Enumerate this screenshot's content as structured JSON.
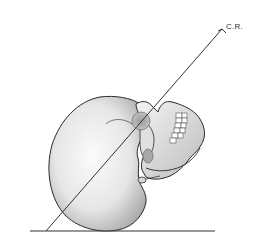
{
  "diagram": {
    "labels": {
      "central_ray": "C.R."
    },
    "colors": {
      "outline": "#2a2a2a",
      "bone_light": "#f2f2f2",
      "bone_shade": "#bdbdbd",
      "line": "#333333"
    }
  }
}
